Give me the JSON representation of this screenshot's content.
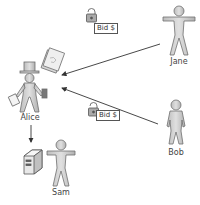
{
  "diagram": {
    "type": "actor-interaction",
    "actors": [
      {
        "id": "alice",
        "label": "Alice",
        "role": "auctioneer"
      },
      {
        "id": "jane",
        "label": "Jane",
        "role": "bidder"
      },
      {
        "id": "bob",
        "label": "Bob",
        "role": "bidder"
      },
      {
        "id": "sam",
        "label": "Sam",
        "role": "observer"
      }
    ],
    "nodes": [
      {
        "id": "server",
        "icon": "server-icon"
      },
      {
        "id": "documents",
        "icon": "document-icon"
      }
    ],
    "messages": [
      {
        "from": "jane",
        "to": "alice",
        "label": "Bid $",
        "icon": "padlock-icon"
      },
      {
        "from": "bob",
        "to": "alice",
        "label": "Bid $",
        "icon": "padlock-icon"
      },
      {
        "from": "alice",
        "to": "server",
        "label": ""
      }
    ]
  },
  "labels": {
    "alice": "Alice",
    "jane": "Jane",
    "bob": "Bob",
    "sam": "Sam",
    "bid_jane": "Bid $",
    "bid_bob": "Bid $"
  },
  "colors": {
    "figure_fill": "#c8c8c8",
    "figure_stroke": "#6e6e6e",
    "arrow": "#333333"
  }
}
